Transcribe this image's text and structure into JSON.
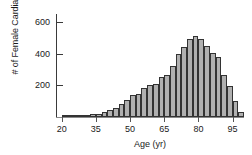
{
  "chart_data": {
    "type": "bar",
    "title": "",
    "subtitle": "",
    "xlabel": "Age (yr)",
    "ylabel": "# of Female Cardiac Patients",
    "xlim": [
      17.5,
      100
    ],
    "ylim": [
      0,
      650
    ],
    "xticks": [
      20,
      35,
      50,
      65,
      80,
      95
    ],
    "yticks": [
      200,
      400,
      600
    ],
    "grid": false,
    "legend": null,
    "bin_width": 2.5,
    "bar_fill": "#b0b0b0",
    "bar_edge": "#333333",
    "categories": [
      "20.0",
      "22.5",
      "25.0",
      "27.5",
      "30.0",
      "32.5",
      "35.0",
      "37.5",
      "40.0",
      "42.5",
      "45.0",
      "47.5",
      "50.0",
      "52.5",
      "55.0",
      "57.5",
      "60.0",
      "62.5",
      "65.0",
      "67.5",
      "70.0",
      "72.5",
      "75.0",
      "77.5",
      "80.0",
      "82.5",
      "85.0",
      "87.5",
      "90.0",
      "92.5",
      "95.0",
      "97.5"
    ],
    "values": [
      5,
      8,
      10,
      12,
      14,
      18,
      22,
      30,
      45,
      60,
      85,
      110,
      140,
      145,
      185,
      205,
      210,
      250,
      265,
      320,
      400,
      440,
      495,
      510,
      490,
      450,
      405,
      380,
      265,
      195,
      100,
      30
    ]
  }
}
